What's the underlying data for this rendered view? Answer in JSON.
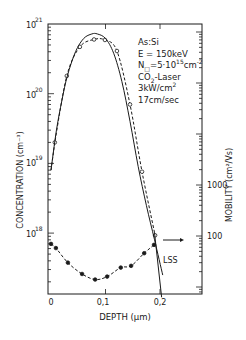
{
  "chart_data": {
    "type": "line",
    "title": "",
    "xlabel": "DEPTH (μm)",
    "ylabel": "CONCENTRATION (cm^-3)",
    "y2label": "MOBILITY (cm^2/Vs)",
    "xlim": [
      0,
      0.277
    ],
    "ylim": [
      1e+17,
      1e+21
    ],
    "y2lim": [
      7,
      1400000.0
    ],
    "yscale": "log",
    "y2scale": "log",
    "grid": false,
    "x_ticks": [
      "0",
      "0,1",
      "0,2"
    ],
    "y_ticks": [
      {
        "base": "10",
        "exp": "21"
      },
      {
        "base": "10",
        "exp": "20"
      },
      {
        "base": "10",
        "exp": "19"
      },
      {
        "base": "10",
        "exp": "18"
      }
    ],
    "y2_ticks": [
      "1000",
      "100"
    ],
    "annotation": {
      "lines": [
        "As:Si",
        "E = 150keV",
        "N□=5·10^15 cm^-2",
        "CO2-Laser",
        "3kW/cm^2",
        "17cm/sec"
      ]
    },
    "series": [
      {
        "name": "Concentration measured (open circles, dashed)",
        "axis": "left",
        "style": "dashed",
        "marker": "open-circle",
        "x": [
          0.007,
          0.029,
          0.053,
          0.079,
          0.099,
          0.121,
          0.145,
          0.167,
          0.191
        ],
        "values": [
          2e+19,
          1.8e+20,
          4.7e+20,
          6e+20,
          5.9e+20,
          4.1e+20,
          7e+19,
          7.6e+18,
          9.3e+17
        ]
      },
      {
        "name": "Concentration fit (solid)",
        "axis": "left",
        "style": "solid",
        "marker": "none",
        "x": [
          0.0,
          0.01,
          0.02,
          0.03,
          0.045,
          0.06,
          0.075,
          0.085,
          0.1,
          0.115,
          0.13,
          0.145,
          0.16,
          0.175,
          0.19,
          0.205
        ],
        "values": [
          8e+18,
          3e+19,
          8e+19,
          1.8e+20,
          4e+20,
          6.2e+20,
          7.2e+20,
          7.2e+20,
          6.2e+20,
          3.8e+20,
          1.5e+20,
          4e+19,
          9e+18,
          2.5e+18,
          8e+17,
          2.5e+17
        ]
      },
      {
        "name": "Mobility (filled dots, dashed)",
        "axis": "right",
        "style": "dashed",
        "marker": "filled-circle",
        "x": [
          0.0,
          0.009,
          0.031,
          0.057,
          0.081,
          0.103,
          0.128,
          0.147,
          0.171,
          0.189
        ],
        "values": [
          70,
          58,
          30,
          18,
          14,
          16,
          24,
          26,
          46,
          67
        ]
      },
      {
        "name": "LSS",
        "axis": "left",
        "style": "solid",
        "marker": "none",
        "label": "LSS",
        "x": [
          0.19,
          0.203
        ],
        "values": [
          1e+18,
          1.2e+17
        ]
      }
    ],
    "arrow": {
      "label": "",
      "points_to": "right axis ~100",
      "direction": "right"
    }
  }
}
